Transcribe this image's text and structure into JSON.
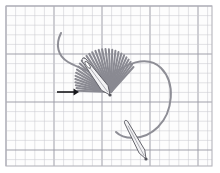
{
  "figure": {
    "width": 220,
    "height": 173,
    "background_color": "#ffffff"
  },
  "grid": {
    "name": "graph-paper-grid",
    "origin_x": 6,
    "origin_y": 6,
    "right": 212,
    "bottom": 166,
    "minor_spacing": 9.6,
    "major_every": 5,
    "minor_color": "#c9c9cf",
    "major_color": "#9a9aa4",
    "minor_width": 0.55,
    "major_width": 0.95,
    "paper_color": "#fdfdfd",
    "border_color": "#b4b4bc"
  },
  "colors": {
    "thread": "#8e8e96",
    "stitch": "#8a8a92",
    "needle_outline": "#55555c",
    "needle_fill": "#f2f2f4",
    "needle_shade": "#9a9aa2",
    "arrow": "#18181c"
  },
  "fan": {
    "name": "fan-stitch-bundle",
    "center_x": 111,
    "center_y": 92,
    "spoke_count": 30,
    "angle_start_deg": 182,
    "angle_end_deg": 312,
    "radius_min": 28,
    "radius_max": 44,
    "stroke_width": 2.0,
    "description": "Radiating straight stitches converging at a single hole"
  },
  "thread_loop": {
    "name": "thread-working-loop",
    "description": "Long curved thread forming a loop from upper-left tail around to lower-right",
    "path": "M 61,33 C 55,45 58,56 68,62 C 80,69 96,73 108,80 C 124,62 148,55 161,68 C 176,83 173,112 158,127 C 144,141 124,140 116,132",
    "stroke_width": 2.0
  },
  "needle_upper": {
    "name": "sewing-needle-upper",
    "description": "Needle angled down-right, eye at top-left, point at fan center",
    "eye_x": 84,
    "eye_y": 60,
    "tip_x": 110,
    "tip_y": 95,
    "half_width": 4.0,
    "eye_hole": true
  },
  "needle_lower": {
    "name": "sewing-needle-lower",
    "description": "Second needle angled down-right below the fan",
    "top_x": 126,
    "top_y": 122,
    "bottom_x": 146,
    "bottom_y": 159,
    "half_width": 3.2
  },
  "arrow": {
    "name": "direction-arrow",
    "description": "Horizontal arrow pointing right toward the stitch bundle",
    "tail_x": 57,
    "head_x": 79,
    "y": 92,
    "stroke_width": 1.6,
    "head_size": 5.5
  }
}
